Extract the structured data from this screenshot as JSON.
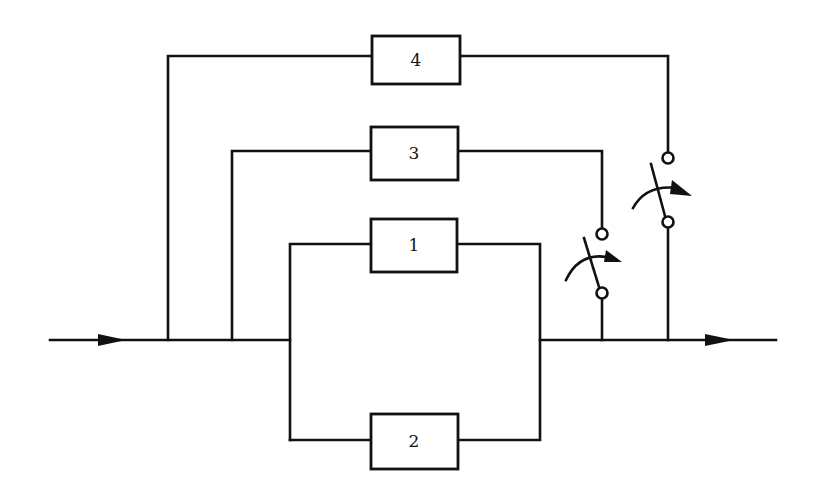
{
  "diagram": {
    "type": "reliability-block-diagram",
    "blocks": [
      {
        "id": "1",
        "label": "1"
      },
      {
        "id": "2",
        "label": "2"
      },
      {
        "id": "3",
        "label": "3"
      },
      {
        "id": "4",
        "label": "4"
      }
    ],
    "switches": [
      {
        "id": "switch-3",
        "controls": "3"
      },
      {
        "id": "switch-4",
        "controls": "4"
      }
    ],
    "flow": {
      "input_arrow": "right-arrow",
      "output_arrow": "right-arrow"
    },
    "colors": {
      "line": "#111111",
      "background": "#ffffff"
    }
  }
}
